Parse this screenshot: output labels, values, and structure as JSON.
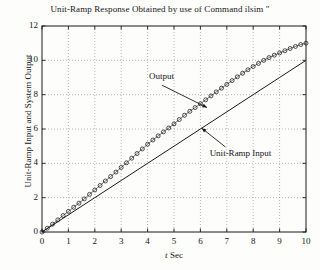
{
  "figure": {
    "width": 320,
    "height": 270,
    "background": "#fdfdfc",
    "ink": "#161616"
  },
  "chart_data": {
    "type": "line",
    "title": "Unit-Ramp Response Obtained by use of Command ilsim \"",
    "xlabel": "t Sec",
    "xlabel_italic_part": "t",
    "xlabel_rest": "Sec",
    "ylabel": "Unit-Ramp Input and System Output",
    "xlim": [
      0,
      10
    ],
    "ylim": [
      0,
      12
    ],
    "xticks": [
      0,
      1,
      2,
      3,
      4,
      5,
      6,
      7,
      8,
      9,
      10
    ],
    "xtick_labels": [
      "0",
      "1",
      "2",
      "3",
      "4",
      "5",
      "6",
      "7",
      "8",
      "9",
      "10"
    ],
    "yticks": [
      0,
      2,
      4,
      6,
      8,
      10,
      12
    ],
    "ytick_labels": [
      "0",
      "2",
      "4",
      "6",
      "8",
      "10",
      "12"
    ],
    "grid": true,
    "grid_style": "dotted",
    "grid_color": "#9a9a9a",
    "legend": "none",
    "annotations": [
      {
        "text": "Output",
        "text_x": 4.05,
        "text_y": 9.05,
        "arrow_from_x": 4.55,
        "arrow_from_y": 8.55,
        "arrow_to_x": 6.25,
        "arrow_to_y": 7.25
      },
      {
        "text": "Unit-Ramp Input",
        "text_x": 6.35,
        "text_y": 4.55,
        "arrow_from_x": 6.95,
        "arrow_from_y": 4.95,
        "arrow_to_x": 6.05,
        "arrow_to_y": 6.05
      }
    ],
    "series": [
      {
        "name": "Unit-Ramp Input",
        "style": "solid-line",
        "color": "#1a1a1a",
        "marker": "none",
        "x": [
          0,
          1,
          2,
          3,
          4,
          5,
          6,
          7,
          8,
          9,
          10
        ],
        "values": [
          0,
          1,
          2,
          3,
          4,
          5,
          6,
          7,
          8,
          9,
          10
        ]
      },
      {
        "name": "Output",
        "style": "circle-markers",
        "color": "#1a1a1a",
        "marker": "open-circle",
        "x": [
          0,
          0.2,
          0.4,
          0.6,
          0.8,
          1.0,
          1.2,
          1.4,
          1.6,
          1.8,
          2.0,
          2.2,
          2.4,
          2.6,
          2.8,
          3.0,
          3.2,
          3.4,
          3.6,
          3.8,
          4.0,
          4.2,
          4.4,
          4.6,
          4.8,
          5.0,
          5.2,
          5.4,
          5.6,
          5.8,
          6.0,
          6.2,
          6.4,
          6.6,
          6.8,
          7.0,
          7.2,
          7.4,
          7.6,
          7.8,
          8.0,
          8.2,
          8.4,
          8.6,
          8.8,
          9.0,
          9.2,
          9.4,
          9.6,
          9.8,
          10.0
        ],
        "values": [
          0.0,
          0.22,
          0.46,
          0.71,
          0.96,
          1.2,
          1.44,
          1.68,
          1.93,
          2.19,
          2.45,
          2.71,
          2.97,
          3.23,
          3.49,
          3.76,
          4.03,
          4.3,
          4.57,
          4.84,
          5.11,
          5.36,
          5.6,
          5.83,
          6.06,
          6.3,
          6.55,
          6.8,
          7.03,
          7.25,
          7.47,
          7.7,
          7.93,
          8.16,
          8.38,
          8.6,
          8.82,
          9.04,
          9.25,
          9.45,
          9.64,
          9.82,
          10.0,
          10.16,
          10.3,
          10.43,
          10.56,
          10.69,
          10.81,
          10.92,
          11.0
        ]
      }
    ]
  },
  "axes": {
    "frame_color": "#1a1a1a",
    "frame_left_px": 42,
    "frame_top_px": 26,
    "frame_right_px": 306,
    "frame_bottom_px": 232
  }
}
